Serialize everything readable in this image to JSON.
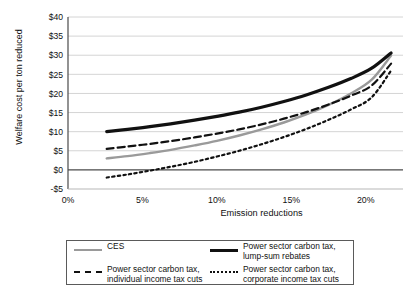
{
  "chart_data": {
    "type": "line",
    "title": "",
    "xlabel": "Emission reductions",
    "ylabel": "Welfare cost per ton reduced",
    "xlim": [
      0,
      22.5
    ],
    "ylim": [
      -5,
      40
    ],
    "xticks": [
      "0%",
      "5%",
      "10%",
      "15%",
      "20%"
    ],
    "xtick_values": [
      0,
      5,
      10,
      15,
      20
    ],
    "yticks": [
      "-$5",
      "$0",
      "$5",
      "$10",
      "$15",
      "$20",
      "$25",
      "$30",
      "$35",
      "$40"
    ],
    "ytick_values": [
      -5,
      0,
      5,
      10,
      15,
      20,
      25,
      30,
      35,
      40
    ],
    "grid": "horizontal",
    "legend_position": "below",
    "zero_line": 0,
    "series": [
      {
        "name": "CES",
        "style": "solid",
        "color": "#9a9a9a",
        "width": 2.4,
        "x": [
          2.6,
          4,
          5.5,
          7,
          8.5,
          10,
          11.5,
          13,
          14.5,
          16,
          17.5,
          19,
          20.4,
          21.7
        ],
        "values": [
          3.0,
          3.6,
          4.4,
          5.3,
          6.4,
          7.6,
          9.0,
          10.6,
          12.4,
          14.5,
          17.0,
          20.0,
          23.6,
          29.9
        ]
      },
      {
        "name": "Power sector carbon tax, lump-sum rebates",
        "style": "solid",
        "color": "#111111",
        "width": 3.2,
        "x": [
          2.6,
          4,
          5.5,
          7,
          8.5,
          10,
          11.5,
          13,
          14.5,
          16,
          17.5,
          19,
          20.4,
          21.7
        ],
        "values": [
          10.0,
          10.6,
          11.3,
          12.1,
          13.0,
          14.0,
          15.1,
          16.4,
          17.9,
          19.6,
          21.6,
          23.9,
          26.6,
          30.6
        ]
      },
      {
        "name": "Power sector carbon tax,\nindividual income tax cuts",
        "style": "dashed",
        "color": "#111111",
        "width": 2.2,
        "x": [
          2.6,
          4,
          5.5,
          7,
          8.5,
          10,
          11.5,
          13,
          14.5,
          16,
          17.5,
          19,
          20.4,
          21.7
        ],
        "values": [
          5.5,
          6.1,
          6.8,
          7.6,
          8.5,
          9.5,
          10.6,
          11.9,
          13.4,
          15.1,
          17.1,
          19.4,
          22.1,
          27.8
        ]
      },
      {
        "name": "Power sector carbon tax,\ncorporate income tax cuts",
        "style": "dotted",
        "color": "#111111",
        "width": 2.2,
        "x": [
          2.6,
          4,
          5.5,
          7,
          8.5,
          10,
          11.5,
          13,
          14.5,
          16,
          17.5,
          19,
          20.4,
          21.7
        ],
        "values": [
          -2.0,
          -1.2,
          -0.2,
          0.9,
          2.1,
          3.5,
          5.0,
          6.7,
          8.6,
          10.7,
          13.1,
          15.8,
          19.0,
          26.0
        ]
      }
    ]
  },
  "legend": {
    "entries": [
      {
        "label": "CES",
        "swatch": "solid-gray"
      },
      {
        "label": "Power sector carbon tax, lump-sum rebates",
        "swatch": "solid-black"
      },
      {
        "label": "Power sector carbon tax,\nindividual income tax cuts",
        "swatch": "dashed"
      },
      {
        "label": "Power sector carbon tax,\ncorporate income tax cuts",
        "swatch": "dotted"
      }
    ]
  }
}
